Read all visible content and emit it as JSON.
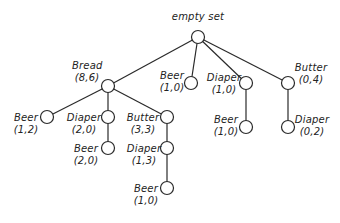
{
  "diagram": {
    "type": "itemset-tree",
    "root": {
      "label": "empty set"
    },
    "nodes": {
      "bread": {
        "item": "Bread",
        "count": "(8,6)"
      },
      "beer_top": {
        "item": "Beer",
        "count": "(1,0)"
      },
      "diaper_top": {
        "item": "Diaper",
        "count": "(1,0)"
      },
      "butter_top": {
        "item": "Butter",
        "count": "(0,4)"
      },
      "bread_beer": {
        "item": "Beer",
        "count": "(1,2)"
      },
      "bread_diaper": {
        "item": "Diaper",
        "count": "(2,0)"
      },
      "bread_butter": {
        "item": "Butter",
        "count": "(3,3)"
      },
      "bread_diaper_beer": {
        "item": "Beer",
        "count": "(2,0)"
      },
      "bread_butter_diaper": {
        "item": "Diaper",
        "count": "(1,3)"
      },
      "bread_butter_diaper_beer": {
        "item": "Beer",
        "count": "(1,0)"
      },
      "diaper_beer": {
        "item": "Beer",
        "count": "(1,0)"
      },
      "butter_diaper": {
        "item": "Diaper",
        "count": "(0,2)"
      }
    },
    "edges": [
      [
        "root",
        "bread"
      ],
      [
        "root",
        "beer_top"
      ],
      [
        "root",
        "diaper_top"
      ],
      [
        "root",
        "butter_top"
      ],
      [
        "bread",
        "bread_beer"
      ],
      [
        "bread",
        "bread_diaper"
      ],
      [
        "bread",
        "bread_butter"
      ],
      [
        "bread_diaper",
        "bread_diaper_beer"
      ],
      [
        "bread_butter",
        "bread_butter_diaper"
      ],
      [
        "bread_butter_diaper",
        "bread_butter_diaper_beer"
      ],
      [
        "diaper_top",
        "diaper_beer"
      ],
      [
        "butter_top",
        "butter_diaper"
      ]
    ],
    "colors": {
      "line": "#2a2a2a",
      "node_fill": "#ffffff",
      "text": "#222222"
    }
  }
}
